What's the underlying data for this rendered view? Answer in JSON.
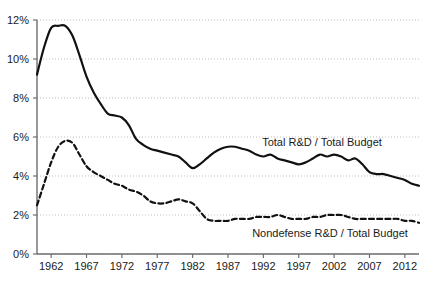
{
  "chart_data": {
    "type": "line",
    "title": "",
    "subtitle": "",
    "xlabel": "",
    "ylabel": "",
    "xlim": [
      1960,
      2014
    ],
    "ylim": [
      0,
      12
    ],
    "grid": true,
    "grid_style": "dotted-horizontal",
    "legend_position": "inline-annotations",
    "y_ticks": [
      0,
      2,
      4,
      6,
      8,
      10,
      12
    ],
    "y_tick_labels": [
      "0%",
      "2%",
      "4%",
      "6%",
      "8%",
      "10%",
      "12%"
    ],
    "x_ticks": [
      1962,
      1967,
      1972,
      1977,
      1982,
      1987,
      1992,
      1997,
      2002,
      2007,
      2012
    ],
    "x_tick_labels": [
      "1962",
      "1967",
      "1972",
      "1977",
      "1982",
      "1987",
      "1992",
      "1997",
      "2002",
      "2007",
      "2012"
    ],
    "x": [
      1960,
      1961,
      1962,
      1963,
      1964,
      1965,
      1966,
      1967,
      1968,
      1969,
      1970,
      1971,
      1972,
      1973,
      1974,
      1975,
      1976,
      1977,
      1978,
      1979,
      1980,
      1981,
      1982,
      1983,
      1984,
      1985,
      1986,
      1987,
      1988,
      1989,
      1990,
      1991,
      1992,
      1993,
      1994,
      1995,
      1996,
      1997,
      1998,
      1999,
      2000,
      2001,
      2002,
      2003,
      2004,
      2005,
      2006,
      2007,
      2008,
      2009,
      2010,
      2011,
      2012,
      2013,
      2014
    ],
    "series": [
      {
        "name": "Total R&D / Total Budget",
        "style": "solid",
        "color": "#111111",
        "label": "Total R&D / Total Budget",
        "values": [
          9.2,
          10.6,
          11.6,
          11.7,
          11.7,
          11.2,
          10.2,
          9.1,
          8.3,
          7.7,
          7.2,
          7.1,
          7.0,
          6.6,
          5.9,
          5.6,
          5.4,
          5.3,
          5.2,
          5.1,
          5.0,
          4.7,
          4.4,
          4.6,
          4.9,
          5.2,
          5.4,
          5.5,
          5.5,
          5.4,
          5.3,
          5.1,
          5.0,
          5.1,
          4.9,
          4.8,
          4.7,
          4.6,
          4.7,
          4.9,
          5.1,
          5.0,
          5.1,
          5.0,
          4.8,
          4.9,
          4.6,
          4.2,
          4.1,
          4.1,
          4.0,
          3.9,
          3.8,
          3.6,
          3.5
        ]
      },
      {
        "name": "Nondefense R&D / Total Budget",
        "style": "dashed",
        "color": "#111111",
        "label": "Nondefense R&D / Total Budget",
        "values": [
          2.5,
          3.6,
          4.7,
          5.5,
          5.8,
          5.7,
          5.1,
          4.5,
          4.2,
          4.0,
          3.8,
          3.6,
          3.5,
          3.3,
          3.2,
          3.0,
          2.7,
          2.6,
          2.6,
          2.7,
          2.8,
          2.7,
          2.6,
          2.2,
          1.8,
          1.7,
          1.7,
          1.7,
          1.8,
          1.8,
          1.8,
          1.9,
          1.9,
          1.9,
          2.0,
          1.9,
          1.8,
          1.8,
          1.8,
          1.9,
          1.9,
          2.0,
          2.0,
          2.0,
          1.9,
          1.8,
          1.8,
          1.8,
          1.8,
          1.8,
          1.8,
          1.8,
          1.7,
          1.7,
          1.6
        ]
      }
    ],
    "annotations": [
      {
        "name": "total-rd-label",
        "text": "Total R&D / Total Budget",
        "x_px": 322,
        "y_px": 146
      },
      {
        "name": "nondefense-rd-label",
        "text": "Nondefense R&D / Total Budget",
        "x_px": 330,
        "y_px": 237
      }
    ]
  }
}
